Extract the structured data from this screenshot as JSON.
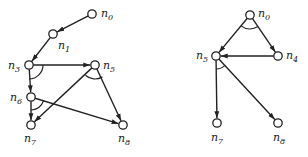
{
  "graphs": [
    {
      "name": "left-graph",
      "nodes": [
        {
          "id": "n0",
          "label": "n",
          "sub": "0",
          "x": 92,
          "y": 14,
          "lx": 101,
          "ly": 17
        },
        {
          "id": "n1",
          "label": "n",
          "sub": "1",
          "x": 53,
          "y": 34,
          "lx": 58,
          "ly": 49
        },
        {
          "id": "n3",
          "label": "n",
          "sub": "3",
          "x": 29,
          "y": 65,
          "lx": 8,
          "ly": 69
        },
        {
          "id": "n5",
          "label": "n",
          "sub": "5",
          "x": 95,
          "y": 65,
          "lx": 103,
          "ly": 69
        },
        {
          "id": "n6",
          "label": "n",
          "sub": "6",
          "x": 31,
          "y": 97,
          "lx": 10,
          "ly": 101
        },
        {
          "id": "n7",
          "label": "n",
          "sub": "7",
          "x": 31,
          "y": 125,
          "lx": 24,
          "ly": 142
        },
        {
          "id": "n8",
          "label": "n",
          "sub": "8",
          "x": 123,
          "y": 125,
          "lx": 118,
          "ly": 142
        }
      ],
      "edges": [
        [
          "n0",
          "n1"
        ],
        [
          "n1",
          "n3"
        ],
        [
          "n3",
          "n5"
        ],
        [
          "n3",
          "n6"
        ],
        [
          "n5",
          "n7"
        ],
        [
          "n5",
          "n8"
        ],
        [
          "n6",
          "n7"
        ],
        [
          "n6",
          "n8"
        ]
      ],
      "and_arcs": [
        {
          "node": "n3",
          "r": 14,
          "a1": 0,
          "a2": 90
        },
        {
          "node": "n5",
          "r": 14,
          "a1": 58,
          "a2": 133
        },
        {
          "node": "n6",
          "r": 13,
          "a1": 17,
          "a2": 90
        }
      ]
    },
    {
      "name": "right-graph",
      "nodes": [
        {
          "id": "n0",
          "label": "n",
          "sub": "0",
          "x": 250,
          "y": 15,
          "lx": 258,
          "ly": 17
        },
        {
          "id": "n4",
          "label": "n",
          "sub": "4",
          "x": 278,
          "y": 56,
          "lx": 286,
          "ly": 59
        },
        {
          "id": "n5",
          "label": "n",
          "sub": "5",
          "x": 216,
          "y": 56,
          "lx": 196,
          "ly": 59
        },
        {
          "id": "n7",
          "label": "n",
          "sub": "7",
          "x": 217,
          "y": 123,
          "lx": 211,
          "ly": 141
        },
        {
          "id": "n8",
          "label": "n",
          "sub": "8",
          "x": 278,
          "y": 123,
          "lx": 273,
          "ly": 141
        }
      ],
      "edges": [
        [
          "n0",
          "n5"
        ],
        [
          "n0",
          "n4"
        ],
        [
          "n4",
          "n5"
        ],
        [
          "n5",
          "n7"
        ],
        [
          "n5",
          "n8"
        ]
      ],
      "and_arcs": [
        {
          "node": "n0",
          "r": 14,
          "a1": 56,
          "a2": 129
        },
        {
          "node": "n5",
          "r": 13,
          "a1": 48,
          "a2": 90
        }
      ]
    }
  ],
  "colors": {
    "stroke": "#222222",
    "background": "#ffffff"
  }
}
